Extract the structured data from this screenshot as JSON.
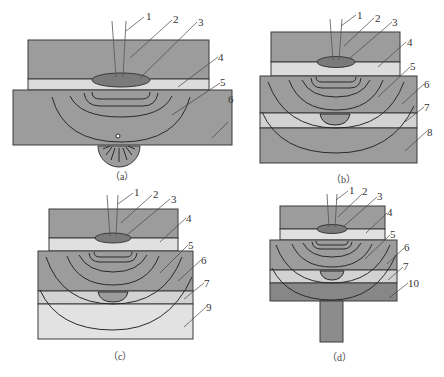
{
  "figure": {
    "colors": {
      "dark_gray": "#9a9a9a",
      "light_gray": "#d9d9d9",
      "very_light": "#e4e4e4",
      "darker_base": "#8a8a8a",
      "ellipse": "#7a7a7a",
      "outline": "#3a3a3a"
    },
    "panels": [
      {
        "id": "a",
        "caption": "（a）",
        "labels": [
          "1",
          "2",
          "3",
          "4",
          "5",
          "6"
        ]
      },
      {
        "id": "b",
        "caption": "（b）",
        "labels": [
          "1",
          "2",
          "3",
          "4",
          "5",
          "6",
          "7",
          "8"
        ]
      },
      {
        "id": "c",
        "caption": "（c）",
        "labels": [
          "1",
          "2",
          "3",
          "4",
          "5",
          "6",
          "7",
          "9"
        ]
      },
      {
        "id": "d",
        "caption": "（d）",
        "labels": [
          "1",
          "2",
          "3",
          "4",
          "5",
          "6",
          "7",
          "10"
        ]
      }
    ]
  }
}
